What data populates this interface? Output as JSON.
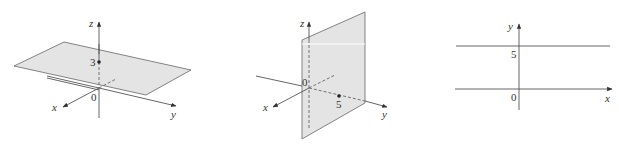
{
  "figures": [
    {
      "id": "panel-1",
      "description": "3D plane z = 3",
      "axis_labels": {
        "x": "x",
        "y": "y",
        "z": "z"
      },
      "origin_label": "0",
      "point_label": "3",
      "plane_color": "#e4e4e4"
    },
    {
      "id": "panel-2",
      "description": "3D plane y = 5",
      "axis_labels": {
        "x": "x",
        "y": "y",
        "z": "z"
      },
      "origin_label": "0",
      "point_label": "5",
      "plane_color": "#e4e4e4"
    },
    {
      "id": "panel-3",
      "description": "2D line y = 5",
      "axis_labels": {
        "x": "x",
        "y": "y"
      },
      "origin_label": "0",
      "point_label": "5"
    }
  ]
}
